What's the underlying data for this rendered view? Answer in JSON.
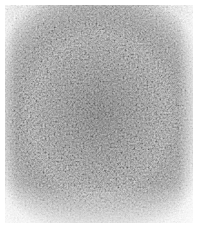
{
  "image": {
    "description": "Grayscale mottled noise texture on white background",
    "colors": {
      "background": "#ffffff",
      "texture_light": "#d4d4d4",
      "texture_mid": "#a8a8a8",
      "texture_dark": "#5a5a5a"
    }
  }
}
